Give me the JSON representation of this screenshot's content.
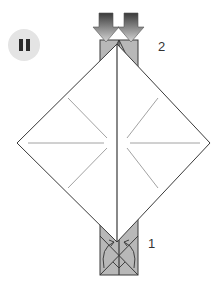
{
  "controls": {
    "pause_icon": "pause-icon"
  },
  "diagram": {
    "type": "origami-fold-diagram",
    "step_labels": [
      {
        "label": "2",
        "x": 158,
        "y": 46
      },
      {
        "label": "1",
        "x": 148,
        "y": 243
      }
    ],
    "colors": {
      "paper_front": "#ffffff",
      "paper_back": "#b3b3b3",
      "outline": "#3a3a3a",
      "crease": "#8a8a8a",
      "arrow_dark": "#444444",
      "arrow_light": "#d0d0d0"
    }
  }
}
